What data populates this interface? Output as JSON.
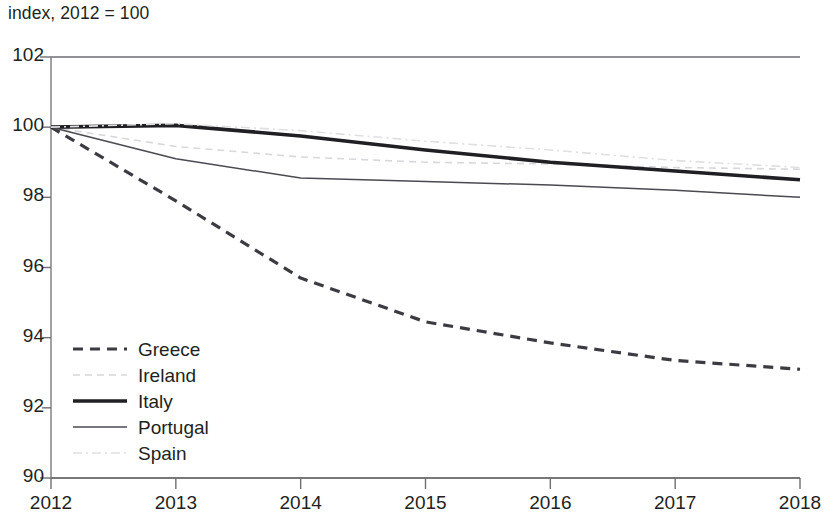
{
  "chart_data": {
    "type": "line",
    "title": "index, 2012 = 100",
    "xlabel": "",
    "ylabel": "",
    "x": [
      2012,
      2013,
      2014,
      2015,
      2016,
      2017,
      2018
    ],
    "xlim": [
      2012,
      2018
    ],
    "ylim": [
      90,
      102
    ],
    "ytick_labels": [
      "102",
      "100",
      "98",
      "96",
      "94",
      "92",
      "90"
    ],
    "yticks": [
      102,
      100,
      98,
      96,
      94,
      92,
      90
    ],
    "xtick_labels": [
      "2012",
      "2013",
      "2014",
      "2015",
      "2016",
      "2017",
      "2018"
    ],
    "grid": false,
    "legend_position": "lower left",
    "series": [
      {
        "name": "Greece",
        "style": "dashed",
        "color": "#3b3b42",
        "width": 3.2,
        "dash": "10,7",
        "values": [
          100,
          97.9,
          95.7,
          94.45,
          93.85,
          93.35,
          93.1
        ]
      },
      {
        "name": "Ireland",
        "style": "dashed",
        "color": "#d8d8dc",
        "width": 1.6,
        "dash": "7,5",
        "values": [
          100,
          99.45,
          99.15,
          99.0,
          98.95,
          98.85,
          98.8
        ]
      },
      {
        "name": "Italy",
        "style": "solid",
        "color": "#1f1f24",
        "width": 3.6,
        "dash": "none",
        "values": [
          100,
          100.05,
          99.75,
          99.35,
          99.0,
          98.75,
          98.5
        ]
      },
      {
        "name": "Portugal",
        "style": "solid",
        "color": "#4a4a52",
        "width": 1.5,
        "dash": "none",
        "values": [
          100,
          99.1,
          98.55,
          98.45,
          98.35,
          98.2,
          98.0
        ]
      },
      {
        "name": "Spain",
        "style": "dashdot",
        "color": "#e0e0e4",
        "width": 1.6,
        "dash": "9,4,2,4",
        "values": [
          100,
          100.1,
          99.9,
          99.6,
          99.35,
          99.05,
          98.85
        ]
      }
    ]
  },
  "axes": {
    "y_tick_values": [
      102,
      100,
      98,
      96,
      94,
      92,
      90
    ],
    "x_tick_values": [
      2012,
      2013,
      2014,
      2015,
      2016,
      2017,
      2018
    ]
  }
}
